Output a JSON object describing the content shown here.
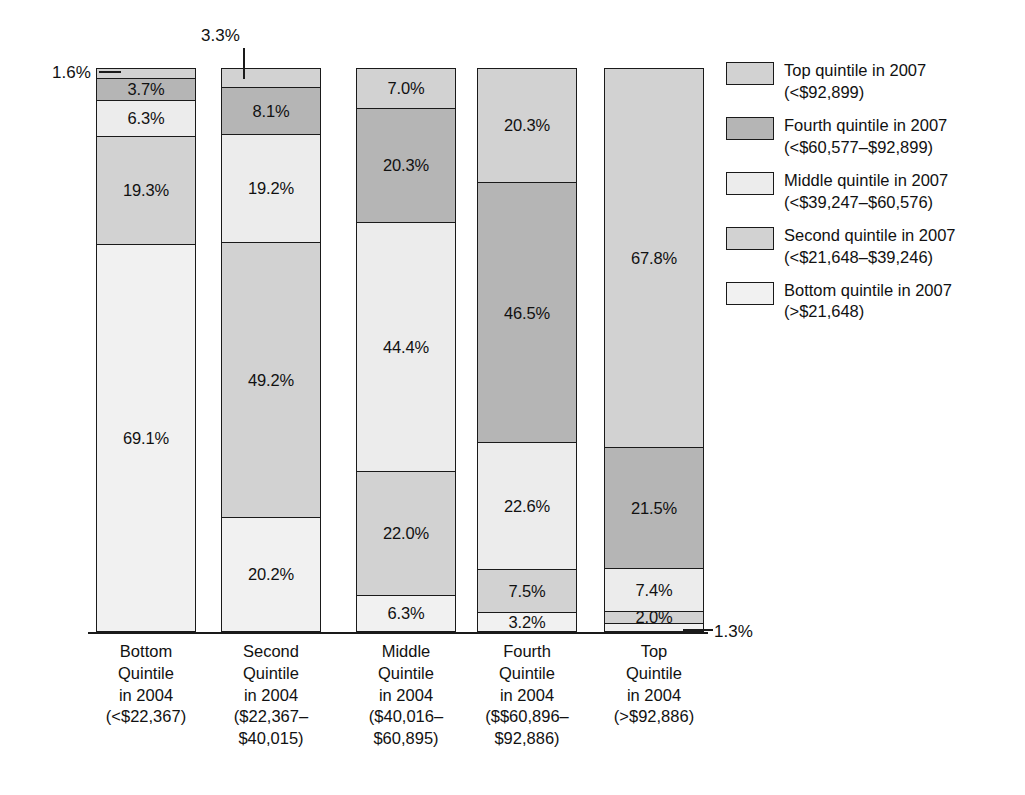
{
  "chart_data": {
    "type": "bar",
    "subtype": "stacked-bar-100",
    "title": "",
    "subtitle": "",
    "xlabel": "",
    "ylabel": "",
    "ylim": [
      0,
      100
    ],
    "grid": false,
    "legend_position": "right",
    "units": "percent",
    "categories": [
      "Bottom Quintile in 2004 (<$22,367)",
      "Second Quintile in 2004 ($22,367–$40,015)",
      "Middle Quintile in 2004 ($40,016–$60,895)",
      "Fourth Quintile in 2004 ($$60,896–$92,886)",
      "Top Quintile in 2004 (>$92,886)"
    ],
    "series": [
      {
        "name": "Top quintile in 2007 (<$92,899)",
        "color": "#d2d2d2",
        "values": [
          1.6,
          3.3,
          7.0,
          20.3,
          67.8
        ]
      },
      {
        "name": "Fourth quintile in 2007 (<$60,577–$92,899)",
        "color": "#b5b5b5",
        "values": [
          3.7,
          8.1,
          20.3,
          46.5,
          21.5
        ]
      },
      {
        "name": "Middle quintile in 2007 (<$39,247–$60,576)",
        "color": "#ececec",
        "values": [
          6.3,
          19.2,
          44.4,
          22.6,
          7.4
        ]
      },
      {
        "name": "Second quintile in 2007 (<$21,648–$39,246)",
        "color": "#d2d2d2",
        "values": [
          19.3,
          49.2,
          22.0,
          7.5,
          2.0
        ]
      },
      {
        "name": "Bottom quintile in 2007 (>$21,648)",
        "color": "#f1f1f1",
        "values": [
          69.1,
          20.2,
          6.3,
          3.2,
          1.3
        ]
      }
    ]
  },
  "bars": [
    {
      "name": "bottom-quintile-2004",
      "segments": [
        {
          "value": "1.6%",
          "pct": 1.6,
          "color": "#d2d2d2",
          "show_label": false
        },
        {
          "value": "3.7%",
          "pct": 3.7,
          "color": "#b5b5b5",
          "show_label": true
        },
        {
          "value": "6.3%",
          "pct": 6.3,
          "color": "#ececec",
          "show_label": true
        },
        {
          "value": "19.3%",
          "pct": 19.3,
          "color": "#d2d2d2",
          "show_label": true
        },
        {
          "value": "69.1%",
          "pct": 69.1,
          "color": "#f1f1f1",
          "show_label": true
        }
      ]
    },
    {
      "name": "second-quintile-2004",
      "segments": [
        {
          "value": "3.3%",
          "pct": 3.3,
          "color": "#d2d2d2",
          "show_label": false
        },
        {
          "value": "8.1%",
          "pct": 8.1,
          "color": "#b5b5b5",
          "show_label": true
        },
        {
          "value": "19.2%",
          "pct": 19.2,
          "color": "#ececec",
          "show_label": true
        },
        {
          "value": "49.2%",
          "pct": 49.2,
          "color": "#d2d2d2",
          "show_label": true
        },
        {
          "value": "20.2%",
          "pct": 20.2,
          "color": "#f1f1f1",
          "show_label": true
        }
      ]
    },
    {
      "name": "middle-quintile-2004",
      "segments": [
        {
          "value": "7.0%",
          "pct": 7.0,
          "color": "#d2d2d2",
          "show_label": true
        },
        {
          "value": "20.3%",
          "pct": 20.3,
          "color": "#b5b5b5",
          "show_label": true
        },
        {
          "value": "44.4%",
          "pct": 44.4,
          "color": "#ececec",
          "show_label": true
        },
        {
          "value": "22.0%",
          "pct": 22.0,
          "color": "#d2d2d2",
          "show_label": true
        },
        {
          "value": "6.3%",
          "pct": 6.3,
          "color": "#f1f1f1",
          "show_label": true
        }
      ]
    },
    {
      "name": "fourth-quintile-2004",
      "segments": [
        {
          "value": "20.3%",
          "pct": 20.3,
          "color": "#d2d2d2",
          "show_label": true
        },
        {
          "value": "46.5%",
          "pct": 46.5,
          "color": "#b5b5b5",
          "show_label": true
        },
        {
          "value": "22.6%",
          "pct": 22.6,
          "color": "#ececec",
          "show_label": true
        },
        {
          "value": "7.5%",
          "pct": 7.5,
          "color": "#d2d2d2",
          "show_label": true
        },
        {
          "value": "3.2%",
          "pct": 3.2,
          "color": "#f1f1f1",
          "show_label": true
        }
      ]
    },
    {
      "name": "top-quintile-2004",
      "segments": [
        {
          "value": "67.8%",
          "pct": 67.8,
          "color": "#d2d2d2",
          "show_label": true
        },
        {
          "value": "21.5%",
          "pct": 21.5,
          "color": "#b5b5b5",
          "show_label": true
        },
        {
          "value": "7.4%",
          "pct": 7.4,
          "color": "#ececec",
          "show_label": true
        },
        {
          "value": "2.0%",
          "pct": 2.0,
          "color": "#d2d2d2",
          "show_label": true
        },
        {
          "value": "1.3%",
          "pct": 1.3,
          "color": "#f1f1f1",
          "show_label": false
        }
      ]
    }
  ],
  "callouts": [
    {
      "name": "callout-1-6",
      "text": "1.6%"
    },
    {
      "name": "callout-3-3",
      "text": "3.3%"
    },
    {
      "name": "callout-1-3",
      "text": "1.3%"
    }
  ],
  "x_axis": {
    "labels": [
      {
        "lines": [
          "Bottom",
          "Quintile",
          "in 2004",
          "(<$22,367)"
        ]
      },
      {
        "lines": [
          "Second",
          "Quintile",
          "in 2004",
          "($22,367–",
          "$40,015)"
        ]
      },
      {
        "lines": [
          "Middle",
          "Quintile",
          "in 2004",
          "($40,016–",
          "$60,895)"
        ]
      },
      {
        "lines": [
          "Fourth",
          "Quintile",
          "in 2004",
          "($$60,896–",
          "$92,886)"
        ]
      },
      {
        "lines": [
          "Top",
          "Quintile",
          "in 2004",
          "(>$92,886)"
        ]
      }
    ]
  },
  "legend": {
    "items": [
      {
        "color": "#d2d2d2",
        "lines": [
          "Top quintile in 2007",
          "(<$92,899)"
        ]
      },
      {
        "color": "#b5b5b5",
        "lines": [
          "Fourth quintile in 2007",
          "(<$60,577–$92,899)"
        ]
      },
      {
        "color": "#ececec",
        "lines": [
          "Middle quintile in 2007",
          "(<$39,247–$60,576)"
        ]
      },
      {
        "color": "#d2d2d2",
        "lines": [
          "Second quintile in 2007",
          "(<$21,648–$39,246)"
        ]
      },
      {
        "color": "#f1f1f1",
        "lines": [
          "Bottom quintile in 2007",
          "(>$21,648)"
        ]
      }
    ]
  }
}
